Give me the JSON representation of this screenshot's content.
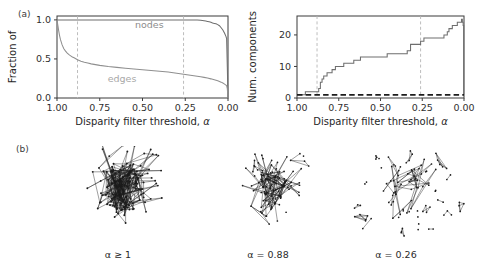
{
  "figure": {
    "panel_a_label": "(a)",
    "panel_b_label": "(b)"
  },
  "chart_data": [
    {
      "type": "line",
      "panel": "a",
      "title": "",
      "xlabel": "Disparity filter threshold, α",
      "ylabel": "Fraction of",
      "xlim": [
        1.0,
        0.0
      ],
      "ylim": [
        0.0,
        1.05
      ],
      "x_reversed": true,
      "xticks": [
        1.0,
        0.75,
        0.5,
        0.25,
        0.0
      ],
      "xticklabels": [
        "1.00",
        "0.75",
        "0.50",
        "0.25",
        "0.00"
      ],
      "yticks": [
        0.0,
        0.5,
        1.0
      ],
      "yticklabels": [
        "0.0",
        "0.5",
        "1.0"
      ],
      "grid": false,
      "legend_position": "inline-annotations",
      "annotations": [
        {
          "text": "nodes",
          "x": 0.46,
          "y": 0.9,
          "color": "#8c8c8c"
        },
        {
          "text": "edges",
          "x": 0.62,
          "y": 0.2,
          "color": "#a8a8a8"
        }
      ],
      "vlines": [
        {
          "x": 0.88,
          "style": "dashed",
          "color": "#b6b6b6"
        },
        {
          "x": 0.26,
          "style": "dashed",
          "color": "#b6b6b6"
        }
      ],
      "series": [
        {
          "name": "nodes",
          "color": "#6e6e6e",
          "x": [
            1.0,
            0.99,
            0.98,
            0.96,
            0.94,
            0.9,
            0.88,
            0.8,
            0.7,
            0.6,
            0.5,
            0.4,
            0.3,
            0.26,
            0.22,
            0.2,
            0.18,
            0.16,
            0.14,
            0.13,
            0.12,
            0.11,
            0.1,
            0.09,
            0.08,
            0.07,
            0.06,
            0.05,
            0.04,
            0.03,
            0.02,
            0.012,
            0.008,
            0.004,
            0.0
          ],
          "y": [
            1.0,
            1.0,
            1.0,
            1.0,
            1.0,
            1.0,
            1.0,
            1.0,
            1.0,
            1.0,
            1.0,
            1.0,
            1.0,
            1.0,
            1.0,
            1.0,
            1.0,
            0.995,
            0.99,
            0.985,
            0.98,
            0.975,
            0.97,
            0.96,
            0.955,
            0.95,
            0.94,
            0.925,
            0.9,
            0.87,
            0.83,
            0.79,
            0.76,
            0.4,
            0.0
          ]
        },
        {
          "name": "edges",
          "color": "#8f8f8f",
          "x": [
            1.0,
            0.995,
            0.99,
            0.985,
            0.98,
            0.97,
            0.96,
            0.95,
            0.94,
            0.93,
            0.92,
            0.91,
            0.9,
            0.88,
            0.86,
            0.84,
            0.82,
            0.8,
            0.75,
            0.7,
            0.65,
            0.6,
            0.55,
            0.5,
            0.45,
            0.4,
            0.35,
            0.3,
            0.26,
            0.22,
            0.2,
            0.18,
            0.16,
            0.14,
            0.12,
            0.1,
            0.08,
            0.06,
            0.05,
            0.04,
            0.03,
            0.02,
            0.012,
            0.008,
            0.004,
            0.0
          ],
          "y": [
            1.0,
            0.93,
            0.86,
            0.8,
            0.75,
            0.68,
            0.63,
            0.6,
            0.575,
            0.555,
            0.54,
            0.525,
            0.515,
            0.49,
            0.472,
            0.458,
            0.447,
            0.437,
            0.418,
            0.403,
            0.392,
            0.382,
            0.372,
            0.363,
            0.353,
            0.343,
            0.332,
            0.318,
            0.305,
            0.292,
            0.286,
            0.279,
            0.272,
            0.264,
            0.255,
            0.245,
            0.233,
            0.22,
            0.212,
            0.203,
            0.192,
            0.178,
            0.165,
            0.158,
            0.12,
            0.0
          ]
        }
      ]
    },
    {
      "type": "line",
      "panel": "a-right",
      "title": "",
      "xlabel": "Disparity filter threshold, α",
      "ylabel": "Num. components",
      "xlim": [
        1.0,
        0.0
      ],
      "ylim": [
        0,
        26
      ],
      "x_reversed": true,
      "xticks": [
        1.0,
        0.75,
        0.5,
        0.25,
        0.0
      ],
      "xticklabels": [
        "1.00",
        "0.75",
        "0.50",
        "0.25",
        "0.00"
      ],
      "yticks": [
        0,
        10,
        20
      ],
      "yticklabels": [
        "0",
        "10",
        "20"
      ],
      "grid": false,
      "legend_position": "none",
      "annotations": [],
      "vlines": [
        {
          "x": 0.88,
          "style": "dashed",
          "color": "#b6b6b6"
        },
        {
          "x": 0.26,
          "style": "dashed",
          "color": "#b6b6b6"
        }
      ],
      "hlines": [
        {
          "y": 1,
          "style": "dashed",
          "color": "#1c1c1c",
          "width": 1.6
        }
      ],
      "series": [
        {
          "name": "num_components",
          "color": "#6e6e6e",
          "step": true,
          "x": [
            1.0,
            0.96,
            0.95,
            0.92,
            0.9,
            0.89,
            0.88,
            0.87,
            0.86,
            0.85,
            0.84,
            0.83,
            0.82,
            0.81,
            0.8,
            0.79,
            0.78,
            0.77,
            0.76,
            0.74,
            0.72,
            0.7,
            0.68,
            0.66,
            0.64,
            0.62,
            0.6,
            0.58,
            0.56,
            0.54,
            0.52,
            0.5,
            0.48,
            0.46,
            0.44,
            0.42,
            0.4,
            0.38,
            0.36,
            0.34,
            0.32,
            0.3,
            0.28,
            0.26,
            0.24,
            0.22,
            0.2,
            0.18,
            0.16,
            0.14,
            0.12,
            0.1,
            0.09,
            0.08,
            0.07,
            0.06,
            0.05,
            0.04,
            0.03,
            0.02,
            0.015,
            0.01,
            0.005,
            0.002,
            0.0
          ],
          "y": [
            1,
            1,
            2,
            2,
            2,
            2,
            2,
            3,
            5,
            6,
            7,
            7,
            8,
            8,
            8,
            9,
            9,
            10,
            10,
            10,
            11,
            11,
            11,
            12,
            12,
            13,
            13,
            13,
            13,
            13,
            13,
            13,
            13,
            14,
            14,
            14,
            14,
            14,
            14,
            15,
            17,
            17,
            17,
            18,
            19,
            19,
            19,
            19,
            19,
            19,
            20,
            21,
            22,
            22,
            23,
            23,
            23,
            24,
            24,
            24,
            25,
            24,
            23,
            1,
            1
          ]
        }
      ]
    }
  ],
  "networks": [
    {
      "caption_prefix": "α",
      "caption_relation": " ≥ ",
      "caption_value": "1",
      "caption_full": "α ≥ 1",
      "density": "dense",
      "seed": 11,
      "nodes": 150,
      "components": 1
    },
    {
      "caption_prefix": "α",
      "caption_relation": " = ",
      "caption_value": "0.88",
      "caption_full": "α = 0.88",
      "density": "medium",
      "seed": 23,
      "nodes": 110,
      "components": 2
    },
    {
      "caption_prefix": "α",
      "caption_relation": " = ",
      "caption_value": "0.26",
      "caption_full": "α = 0.26",
      "density": "sparse",
      "seed": 37,
      "nodes": 80,
      "components": 19
    }
  ],
  "colors": {
    "nodes_curve": "#6e6e6e",
    "edges_curve": "#8f8f8f",
    "components_curve": "#6e6e6e",
    "dashed_vline": "#b6b6b6",
    "dashed_hline": "#1c1c1c",
    "axis": "#3b3b3b",
    "network_ink": "#1b1b1b",
    "background": "#ffffff"
  }
}
